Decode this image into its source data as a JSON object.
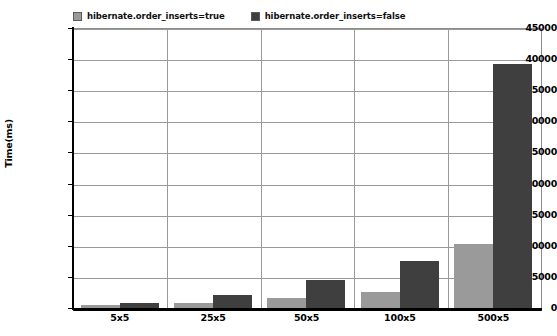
{
  "chart_data": {
    "type": "bar",
    "title": "",
    "xlabel": "",
    "ylabel": "Time(ms)",
    "categories": [
      "5x5",
      "25x5",
      "50x5",
      "100x5",
      "500x5"
    ],
    "series": [
      {
        "name": "hibernate.order_inserts=true",
        "color": "#9a9a9a",
        "values": [
          480,
          800,
          1600,
          2600,
          10300
        ]
      },
      {
        "name": "hibernate.order_inserts=false",
        "color": "#3f3f3f",
        "values": [
          800,
          2100,
          4500,
          7550,
          39200
        ]
      }
    ],
    "ylim": [
      0,
      45000
    ],
    "yticks": [
      0,
      5000,
      10000,
      15000,
      20000,
      25000,
      30000,
      35000,
      40000,
      45000
    ],
    "ytick_labels": [
      "0",
      "5000",
      "10000",
      "15000",
      "20000",
      "25000",
      "30000",
      "35000",
      "40000",
      "45000"
    ],
    "grid": true,
    "legend_position": "top-left",
    "bar_layout": "grouped"
  },
  "legend": {
    "entries": [
      {
        "label": "hibernate.order_inserts=true",
        "swatch_name": "legend-swatch-order-inserts-true"
      },
      {
        "label": "hibernate.order_inserts=false",
        "swatch_name": "legend-swatch-order-inserts-false"
      }
    ]
  },
  "axes": {
    "y_title": "Time(ms)"
  }
}
